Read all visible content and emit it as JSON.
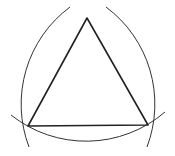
{
  "diagram": {
    "type": "equilateral-triangle-compass-construction",
    "stroke_color": "#222222",
    "background": "#ffffff",
    "vertices": {
      "top": [
        87,
        18
      ],
      "bottom_left": [
        28,
        126
      ],
      "bottom_right": [
        148,
        125
      ]
    },
    "arc_radius": 121
  }
}
